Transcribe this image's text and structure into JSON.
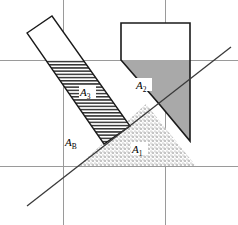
{
  "figure": {
    "title": "",
    "type": "geometry-diagram",
    "background_color": "#ffffff",
    "outline_color": "#1a1a1a",
    "grid_color": "#9a9a9a",
    "labels": {
      "a3": {
        "base": "A",
        "sub": "3",
        "x": 86,
        "y": 95
      },
      "a2": {
        "base": "A",
        "sub": "2",
        "x": 142,
        "y": 88
      },
      "a1": {
        "base": "A",
        "sub": "1",
        "x": 138,
        "y": 152
      },
      "ab": {
        "base": "A",
        "sub": "B",
        "x": 72,
        "y": 146
      }
    },
    "grid": {
      "horizontal_lines": [
        60,
        166
      ],
      "vertical_lines": [
        63,
        165
      ],
      "line_width": 1
    },
    "diagonal": {
      "x1": 27,
      "y1": 206,
      "x2": 231,
      "y2": 47,
      "line_width": 1.2
    },
    "hatched_rect": {
      "fill_pattern": "horizontal-hatch",
      "points": "27,33 52,16 130,126 104,144"
    },
    "a2_polygon": {
      "fill": "#a9a9a9",
      "points": "121,23 190,23 190,141 160,105 121,60"
    },
    "a1_triangle": {
      "fill_pattern": "dots",
      "points": "146,104 196,166 78,166"
    }
  },
  "colors": {
    "shape_gray": "#a9a9a9",
    "stroke_dark": "#1a1a1a",
    "grid_gray": "#9a9a9a",
    "dot_gray": "#6e6e6e"
  }
}
